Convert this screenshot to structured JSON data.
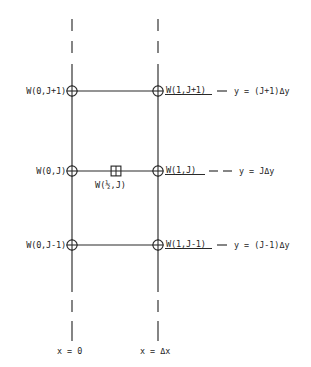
{
  "figure": {
    "kind": "finite-difference-grid-stencil",
    "background_color": "#ffffff",
    "line_color": "#2a2a2a"
  },
  "nodes": {
    "left_column": [
      {
        "id": "w-0-jplus1",
        "label": "W(0,J+1)",
        "marker": "circle-cross-icon"
      },
      {
        "id": "w-0-j",
        "label": "W(0,J)",
        "marker": "circle-cross-icon"
      },
      {
        "id": "w-0-jminus1",
        "label": "W(0,J-1)",
        "marker": "circle-cross-icon"
      }
    ],
    "right_column": [
      {
        "id": "w-1-jplus1",
        "label_prefix": "W(",
        "label_unknown": "1",
        "label_mid": ",J+",
        "label_unknown2": "1",
        "label_suffix": ")",
        "marker": "circle-cross-icon"
      },
      {
        "id": "w-1-j",
        "label_prefix": "W(",
        "label_unknown": "1",
        "label_mid": ",J",
        "label_unknown2": "",
        "label_suffix": ")",
        "marker": "circle-cross-icon"
      },
      {
        "id": "w-1-jminus1",
        "label_prefix": "W(",
        "label_unknown": "1",
        "label_mid": ",J-",
        "label_unknown2": "1",
        "label_suffix": ")",
        "marker": "circle-cross-icon"
      }
    ],
    "midpoint": {
      "id": "w-half-j",
      "label": "W(½,J)",
      "marker": "square-cross-icon"
    }
  },
  "y_coordinates": [
    {
      "id": "y-top",
      "text": "y = (J+1)Δy"
    },
    {
      "id": "y-middle",
      "text": "y = JΔy"
    },
    {
      "id": "y-bottom",
      "text": "y = (J-1)Δy"
    }
  ],
  "x_axis_labels": [
    {
      "id": "x-zero",
      "text": "x = 0"
    },
    {
      "id": "x-delta",
      "text": "x = Δx"
    }
  ]
}
